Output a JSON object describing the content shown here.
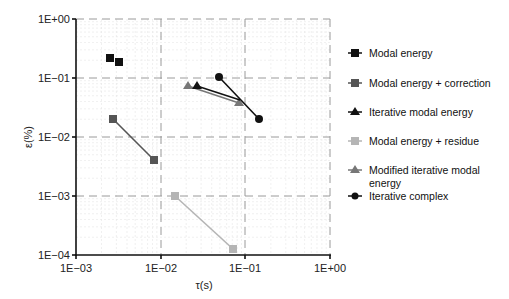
{
  "chart_data": {
    "type": "scatter",
    "title": "",
    "xlabel": "τ(s)",
    "ylabel": "ε(%)",
    "xscale": "log",
    "yscale": "log",
    "xlim": [
      0.001,
      1
    ],
    "ylim": [
      0.0001,
      1
    ],
    "x_ticks": [
      "1E−03",
      "1E−02",
      "1E−01",
      "1E+00"
    ],
    "y_ticks": [
      "1E+00",
      "1E−01",
      "1E−02",
      "1E−03",
      "1E−04"
    ],
    "grid": true,
    "legend_position": "right",
    "series": [
      {
        "name": "Modal energy",
        "marker": "square",
        "color": "#111111",
        "line": false,
        "points": [
          [
            0.0025,
            0.21
          ],
          [
            0.0032,
            0.18
          ]
        ]
      },
      {
        "name": "Modal energy + correction",
        "marker": "square",
        "color": "#555555",
        "line": true,
        "points": [
          [
            0.0028,
            0.02
          ],
          [
            0.0083,
            0.0042
          ]
        ]
      },
      {
        "name": "Iterative modal energy",
        "marker": "triangle",
        "color": "#111111",
        "line": true,
        "points": [
          [
            0.026,
            0.07
          ],
          [
            0.085,
            0.043
          ]
        ]
      },
      {
        "name": "Modal energy + residue",
        "marker": "square",
        "color": "#b5b5b5",
        "line": true,
        "points": [
          [
            0.0145,
            0.001
          ],
          [
            0.07,
            0.000125
          ]
        ]
      },
      {
        "name": "Modified iterative modal energy",
        "marker": "triangle",
        "color": "#777777",
        "line": true,
        "points": [
          [
            0.021,
            0.07
          ],
          [
            0.085,
            0.038
          ]
        ]
      },
      {
        "name": "Iterative complex",
        "marker": "circle",
        "color": "#111111",
        "line": true,
        "points": [
          [
            0.047,
            0.1
          ],
          [
            0.14,
            0.02
          ]
        ]
      }
    ]
  },
  "legend": {
    "items": [
      {
        "label": "Modal energy"
      },
      {
        "label": "Modal energy + correction"
      },
      {
        "label": "Iterative modal energy"
      },
      {
        "label": "Modal energy + residue"
      },
      {
        "label_line1": "Modified iterative modal",
        "label_line2": "energy"
      },
      {
        "label": "Iterative complex"
      }
    ]
  },
  "axes": {
    "xlabel": "τ(s)",
    "ylabel": "ε(%)",
    "x_ticks": [
      "1E−03",
      "1E−02",
      "1E−01",
      "1E+00"
    ],
    "y_ticks": [
      "1E+00",
      "1E−01",
      "1E−02",
      "1E−03",
      "1E−04"
    ]
  }
}
